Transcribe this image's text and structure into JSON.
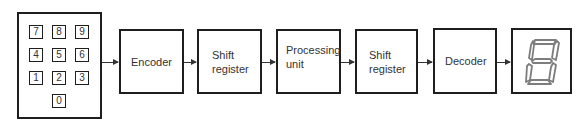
{
  "diagram": {
    "type": "block-diagram",
    "keypad": {
      "keys": [
        {
          "label": "7",
          "row": 0,
          "col": 0
        },
        {
          "label": "8",
          "row": 0,
          "col": 1
        },
        {
          "label": "9",
          "row": 0,
          "col": 2
        },
        {
          "label": "4",
          "row": 1,
          "col": 0
        },
        {
          "label": "5",
          "row": 1,
          "col": 1
        },
        {
          "label": "6",
          "row": 1,
          "col": 2
        },
        {
          "label": "1",
          "row": 2,
          "col": 0
        },
        {
          "label": "2",
          "row": 2,
          "col": 1
        },
        {
          "label": "3",
          "row": 2,
          "col": 2
        },
        {
          "label": "0",
          "row": 3,
          "col": 1
        }
      ]
    },
    "blocks": [
      {
        "id": "encoder",
        "label": "Encoder"
      },
      {
        "id": "shift-register-1",
        "label": "Shift\nregister"
      },
      {
        "id": "processing-unit",
        "label": "Processing\nunit"
      },
      {
        "id": "shift-register-2",
        "label": "Shift\nregister"
      },
      {
        "id": "decoder",
        "label": "Decoder"
      }
    ],
    "display": {
      "type": "seven-segment",
      "digit": "8",
      "segment_color": "#8a8a8a"
    },
    "edges": [
      {
        "from": "keypad",
        "to": "encoder"
      },
      {
        "from": "encoder",
        "to": "shift-register-1"
      },
      {
        "from": "shift-register-1",
        "to": "processing-unit"
      },
      {
        "from": "processing-unit",
        "to": "shift-register-2"
      },
      {
        "from": "shift-register-2",
        "to": "decoder"
      },
      {
        "from": "decoder",
        "to": "display"
      }
    ]
  }
}
